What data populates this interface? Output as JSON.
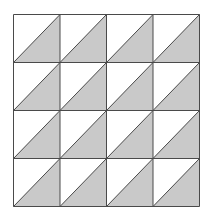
{
  "diagram": {
    "type": "triangle-tiling",
    "rows": 4,
    "cols": 4,
    "grid_left": 13.5,
    "grid_top": 14.5,
    "grid_right": 199.5,
    "grid_bottom": 206.5,
    "shaded_half": "lower-right",
    "diagonal_direction": "bottom-left-to-top-right",
    "colors": {
      "background": "#ffffff",
      "fill": "#c9c9c9",
      "line": "#4a4a4a"
    }
  }
}
